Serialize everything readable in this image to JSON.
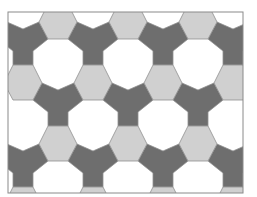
{
  "figure": {
    "frame": {
      "x": 8,
      "y": 12,
      "width": 235,
      "height": 181,
      "stroke": "#8a8a8a"
    },
    "colors": {
      "hexagon": "#d0d0d0",
      "y_tile": "#6e6e6e",
      "gap": "#ffffff",
      "edge": "#8f8f8f"
    },
    "lattice": {
      "horizontal_period": 70,
      "vertical_half_period": 61,
      "rows": [
        {
          "hex_y": -39,
          "hex_x": [
            23,
            93,
            163,
            233
          ],
          "y_tile_x": [
            58,
            128,
            198
          ]
        },
        {
          "hex_y": 22,
          "hex_x": [
            58,
            128,
            198
          ],
          "y_tile_x": [
            23,
            93,
            163,
            233
          ]
        },
        {
          "hex_y": 83,
          "hex_x": [
            23,
            93,
            163,
            233
          ],
          "y_tile_x": [
            58,
            128,
            198
          ]
        },
        {
          "hex_y": 144,
          "hex_x": [
            58,
            128,
            198
          ],
          "y_tile_x": [
            23,
            93,
            163,
            233
          ]
        },
        {
          "hex_y": 205,
          "hex_x": [
            23,
            93,
            163,
            233
          ],
          "y_tile_x": [
            58,
            128,
            198
          ]
        }
      ]
    }
  }
}
